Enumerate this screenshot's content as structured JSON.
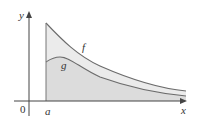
{
  "diagram": {
    "type": "area-between-curves",
    "axes": {
      "x_label": "x",
      "y_label": "y",
      "origin_label": "0"
    },
    "markers": {
      "a_label": "a"
    },
    "curves": [
      {
        "name": "f",
        "label": "f",
        "color": "#6b6b6b"
      },
      {
        "name": "g",
        "label": "g",
        "color": "#6b6b6b"
      }
    ],
    "colors": {
      "region_between": "#e8e8e8",
      "region_under_g": "#d9d9d9",
      "axis": "#444444"
    }
  }
}
